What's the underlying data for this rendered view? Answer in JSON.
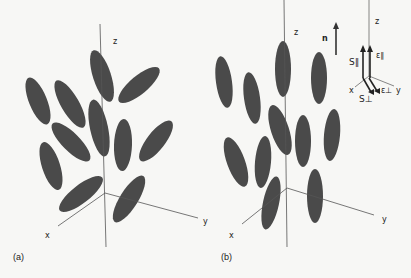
{
  "figure": {
    "panels": [
      {
        "label": "(a)",
        "description": "smectic-like tilted ellipsoids",
        "axes": {
          "z": "z",
          "x": "x",
          "y": "y"
        },
        "ellipses": [
          {
            "cx": 38,
            "cy": 101,
            "rx": 9,
            "ry": 25,
            "rot": -22
          },
          {
            "cx": 70,
            "cy": 104,
            "rx": 9,
            "ry": 27,
            "rot": -30
          },
          {
            "cx": 102,
            "cy": 76,
            "rx": 9,
            "ry": 27,
            "rot": -18
          },
          {
            "cx": 139,
            "cy": 85,
            "rx": 9,
            "ry": 26,
            "rot": 50
          },
          {
            "cx": 99,
            "cy": 128,
            "rx": 9,
            "ry": 29,
            "rot": -12
          },
          {
            "cx": 71,
            "cy": 142,
            "rx": 9,
            "ry": 26,
            "rot": -45
          },
          {
            "cx": 123,
            "cy": 145,
            "rx": 9,
            "ry": 26,
            "rot": 2
          },
          {
            "cx": 156,
            "cy": 141,
            "rx": 9,
            "ry": 25,
            "rot": 38
          },
          {
            "cx": 51,
            "cy": 166,
            "rx": 9,
            "ry": 25,
            "rot": -18
          },
          {
            "cx": 81,
            "cy": 194,
            "rx": 9,
            "ry": 27,
            "rot": 52
          },
          {
            "cx": 129,
            "cy": 199,
            "rx": 9,
            "ry": 27,
            "rot": 32
          }
        ]
      },
      {
        "label": "(b)",
        "description": "nematic-like aligned ellipsoids",
        "axes": {
          "z": "z",
          "x": "x",
          "y": "y"
        },
        "ellipses": [
          {
            "cx": 224,
            "cy": 82,
            "rx": 8,
            "ry": 26,
            "rot": -8
          },
          {
            "cx": 252,
            "cy": 98,
            "rx": 8,
            "ry": 26,
            "rot": -8
          },
          {
            "cx": 283,
            "cy": 69,
            "rx": 8,
            "ry": 28,
            "rot": 0
          },
          {
            "cx": 319,
            "cy": 78,
            "rx": 8,
            "ry": 26,
            "rot": 0
          },
          {
            "cx": 280,
            "cy": 130,
            "rx": 9,
            "ry": 26,
            "rot": -18
          },
          {
            "cx": 303,
            "cy": 141,
            "rx": 8,
            "ry": 26,
            "rot": 0
          },
          {
            "cx": 332,
            "cy": 135,
            "rx": 8,
            "ry": 26,
            "rot": 5
          },
          {
            "cx": 236,
            "cy": 162,
            "rx": 9,
            "ry": 26,
            "rot": -20
          },
          {
            "cx": 263,
            "cy": 162,
            "rx": 8,
            "ry": 26,
            "rot": 5
          },
          {
            "cx": 271,
            "cy": 203,
            "rx": 8,
            "ry": 27,
            "rot": 12
          },
          {
            "cx": 315,
            "cy": 196,
            "rx": 8,
            "ry": 27,
            "rot": 0
          }
        ]
      }
    ],
    "director_label": "n",
    "inset": {
      "axis_labels": {
        "z": "z",
        "x": "x",
        "y": "y"
      },
      "vectors": [
        {
          "label": "S∥",
          "direction": "z"
        },
        {
          "label": "ε∥",
          "direction": "z"
        },
        {
          "label": "S⊥",
          "direction": "x"
        },
        {
          "label": "ε⊥",
          "direction": "x"
        }
      ]
    },
    "colors": {
      "ellipse": "#4a4a4a",
      "axis": "#555555",
      "background": "#f7f7f5"
    }
  }
}
